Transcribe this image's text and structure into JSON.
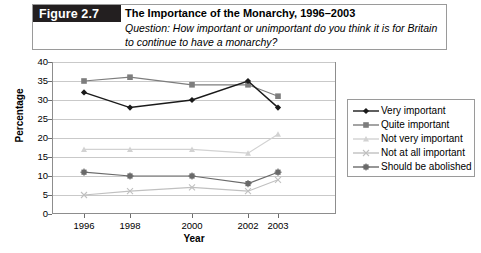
{
  "figure": {
    "tag": "Figure 2.7",
    "title": "The Importance of the Monarchy, 1996–2003",
    "question": "Question: How important or unimportant do you think it is for Britain to continue to have a monarchy?"
  },
  "legend": {
    "position": "right",
    "items": [
      {
        "label": "Very important",
        "marker": "diamond",
        "color": "#1a1a1a"
      },
      {
        "label": "Quite important",
        "marker": "square",
        "color": "#7d7d7d"
      },
      {
        "label": "Not very important",
        "marker": "triangle",
        "color": "#d2d2d2"
      },
      {
        "label": "Not at all important",
        "marker": "cross",
        "color": "#c0c0c0"
      },
      {
        "label": "Should be abolished",
        "marker": "asterisk-square",
        "color": "#6a6a6a"
      }
    ]
  },
  "chart_data": {
    "type": "line",
    "title": "The Importance of the Monarchy, 1996–2003",
    "xlabel": "Year",
    "ylabel": "Percentage",
    "categories": [
      "1996",
      "1998",
      "2000",
      "2002",
      "2003"
    ],
    "ylim": [
      0,
      40
    ],
    "ytick_step": 5,
    "yticks": [
      "0",
      "5",
      "10",
      "15",
      "20",
      "25",
      "30",
      "35",
      "40"
    ],
    "grid": true,
    "series": [
      {
        "name": "Very important",
        "color": "#1a1a1a",
        "marker": "diamond",
        "values": [
          32,
          28,
          30,
          35,
          28
        ]
      },
      {
        "name": "Quite important",
        "color": "#7d7d7d",
        "marker": "square",
        "values": [
          35,
          36,
          34,
          34,
          31
        ]
      },
      {
        "name": "Not very important",
        "color": "#d2d2d2",
        "marker": "triangle",
        "values": [
          17,
          17,
          17,
          16,
          21
        ]
      },
      {
        "name": "Not at all important",
        "color": "#c0c0c0",
        "marker": "cross",
        "values": [
          5,
          6,
          7,
          6,
          9
        ]
      },
      {
        "name": "Should be abolished",
        "color": "#6a6a6a",
        "marker": "asterisk-square",
        "values": [
          11,
          10,
          10,
          8,
          11
        ]
      }
    ]
  }
}
